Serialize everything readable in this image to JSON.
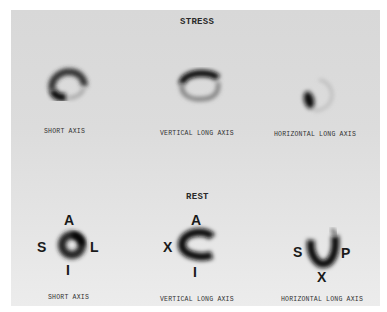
{
  "figure": {
    "panels": [
      {
        "heading": "STRESS",
        "views": [
          {
            "caption": "SHORT AXIS"
          },
          {
            "caption": "VERTICAL LONG AXIS"
          },
          {
            "caption": "HORIZONTAL LONG AXIS"
          }
        ]
      },
      {
        "heading": "REST",
        "views": [
          {
            "caption": "SHORT AXIS",
            "labels": {
              "top": "A",
              "left": "S",
              "right": "L",
              "bottom": "I"
            }
          },
          {
            "caption": "VERTICAL LONG AXIS",
            "labels": {
              "top": "A",
              "left": "X",
              "bottom": "I"
            }
          },
          {
            "caption": "HORIZONTAL LONG AXIS",
            "labels": {
              "left": "S",
              "right": "P",
              "bottom": "X"
            }
          }
        ]
      }
    ]
  }
}
